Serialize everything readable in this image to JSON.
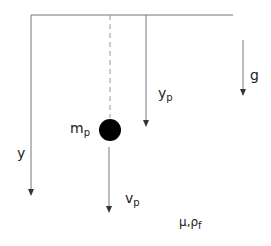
{
  "diagram": {
    "labels": {
      "y": "y",
      "yp_main": "y",
      "yp_sub": "p",
      "g": "g",
      "mp_main": "m",
      "mp_sub": "p",
      "vp_main": "v",
      "vp_sub": "p",
      "fluid_main": "μ,ρ",
      "fluid_sub": "f"
    },
    "colors": {
      "line": "#777777",
      "particle": "#000000",
      "text": "#222222"
    }
  }
}
